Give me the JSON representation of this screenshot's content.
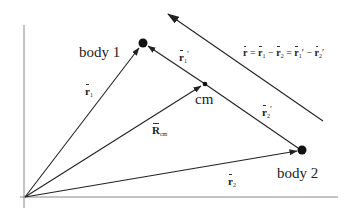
{
  "diagram": {
    "colors": {
      "line": "#222222",
      "axis": "#888888",
      "background": "#ffffff"
    },
    "points": {
      "origin": {
        "x": 25,
        "y": 197
      },
      "body1": {
        "x": 143,
        "y": 43,
        "label": "body 1"
      },
      "cm": {
        "x": 205,
        "y": 84,
        "label": "cm"
      },
      "body2": {
        "x": 302,
        "y": 150,
        "label": "body 2"
      }
    },
    "vectors": [
      {
        "id": "r1",
        "label": "r̄₁",
        "from": "origin",
        "to": "body1"
      },
      {
        "id": "Rcm",
        "label": "R̄cm",
        "from": "origin",
        "to": "cm"
      },
      {
        "id": "r2",
        "label": "r̄₂",
        "from": "origin",
        "to": "body2"
      },
      {
        "id": "r1prime",
        "label": "r̄₁′",
        "from": "cm",
        "to": "body1"
      },
      {
        "id": "r2prime",
        "label": "r̄₂′",
        "from": "cm",
        "to": "body2"
      },
      {
        "id": "r",
        "label": "r̄",
        "from": "body2",
        "to": "body1",
        "note": "drawn offset, parallel"
      }
    ],
    "labels": {
      "body1": "body 1",
      "body2": "body 2",
      "cm": "cm",
      "r1_main": "r",
      "r1_sub": "1",
      "r2_main": "r",
      "r2_sub": "2",
      "Rcm_main": "R",
      "Rcm_sub": "cm",
      "r1p_main": "r",
      "r1p_sub": "1",
      "r1p_prime": "′",
      "r2p_main": "r",
      "r2p_sub": "2",
      "r2p_prime": "′",
      "equation": {
        "r": "r",
        "eq1": " = ",
        "r1": "r",
        "s1": "1",
        "minus1": " − ",
        "r2": "r",
        "s2": "2",
        "eq2": " = ",
        "r1p": "r",
        "s1p": "1",
        "p1": "′",
        "minus2": " − ",
        "r2p": "r",
        "s2p": "2",
        "p2": "′"
      }
    }
  }
}
